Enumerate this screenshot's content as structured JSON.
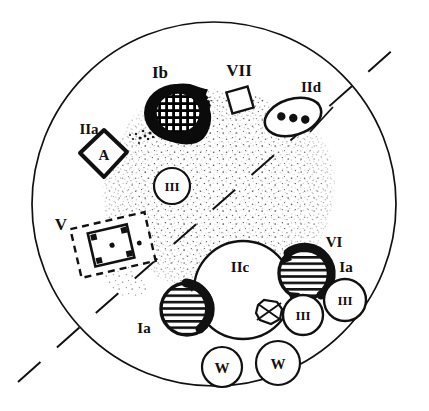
{
  "figure": {
    "background_color": "#ffffff",
    "ink_color": "#111111",
    "outline": {
      "name": "cell-boundary-circle",
      "cx": 214,
      "cy": 204,
      "rx": 182,
      "ry": 182
    },
    "section_line": {
      "name": "dashed-section-line",
      "style": "dashed",
      "x1": 18,
      "y1": 382,
      "x2": 404,
      "y2": 40
    },
    "stipple_region": {
      "name": "stippled-cytoplasm-zone",
      "description": "irregular dotted / stippled blob occupying the central region"
    }
  },
  "labels": [
    {
      "id": "Ib",
      "text": "Ib",
      "x": 160,
      "y": 78,
      "size": "lg"
    },
    {
      "id": "VII",
      "text": "VII",
      "x": 218,
      "y": 75,
      "size": "lg"
    },
    {
      "id": "IId",
      "text": "IId",
      "x": 292,
      "y": 90,
      "size": "md"
    },
    {
      "id": "IIa",
      "text": "IIa",
      "x": 73,
      "y": 133,
      "size": "md"
    },
    {
      "id": "V",
      "text": "V",
      "x": 57,
      "y": 228,
      "size": "lg"
    },
    {
      "id": "VI",
      "text": "VI",
      "x": 323,
      "y": 244,
      "size": "md"
    },
    {
      "id": "Ia_right",
      "text": "Ia",
      "x": 336,
      "y": 270,
      "size": "md"
    },
    {
      "id": "IIc",
      "text": "IIc",
      "x": 232,
      "y": 268,
      "size": "md"
    },
    {
      "id": "Ia_left",
      "text": "Ia",
      "x": 136,
      "y": 331,
      "size": "md"
    }
  ],
  "organelles": [
    {
      "name": "Ib-crosshatched-body",
      "label": "Ib",
      "shape": "blob",
      "fill": "black-with-grid-hatch",
      "cx": 176,
      "cy": 113,
      "rx": 31,
      "ry": 27
    },
    {
      "name": "VII-square",
      "label": "VII",
      "shape": "rotated-square",
      "fill": "white",
      "cx": 240,
      "cy": 99,
      "size": 20,
      "rotation": -15
    },
    {
      "name": "IId-ellipse-with-dots",
      "label": "IId",
      "shape": "ellipse",
      "fill": "white",
      "cx": 292,
      "cy": 116,
      "rx": 27,
      "ry": 17,
      "rotation": -18,
      "inner_dots": 3
    },
    {
      "name": "IIa-diamond-A",
      "label": "IIa",
      "inner_text": "A",
      "shape": "rounded-diamond",
      "fill": "white",
      "cx": 104,
      "cy": 155,
      "size": 23
    },
    {
      "name": "III-circle-center",
      "label": "III",
      "inner_text": "III",
      "shape": "circle",
      "fill": "white",
      "cx": 172,
      "cy": 186,
      "r": 17
    },
    {
      "name": "V-dashed-box",
      "label": "V",
      "shape": "dashed-rectangle-with-inner-square",
      "fill": "white",
      "cx": 113,
      "cy": 244,
      "w": 74,
      "h": 48,
      "rotation": -13,
      "inner_corner_squares": 4,
      "inner_center_dot": true
    },
    {
      "name": "IIc-large-circle",
      "label": "IIc",
      "inner_text": "IIc",
      "shape": "circle",
      "fill": "white",
      "cx": 243,
      "cy": 290,
      "r": 48
    },
    {
      "name": "Ia-striped-circle-left",
      "label": "Ia",
      "shape": "circle-horizontal-stripes-thick-arc",
      "fill": "striped",
      "cx": 187,
      "cy": 308,
      "r": 25
    },
    {
      "name": "Ia-striped-circle-right",
      "label": "Ia",
      "shape": "circle-horizontal-stripes-thick-arc",
      "fill": "striped",
      "cx": 305,
      "cy": 273,
      "r": 25
    },
    {
      "name": "X-marked-polygon",
      "shape": "octagon-with-cross",
      "fill": "white",
      "cx": 270,
      "cy": 312,
      "r": 14
    },
    {
      "name": "III-circle-lower",
      "label": "III",
      "inner_text": "III",
      "shape": "circle",
      "fill": "white",
      "cx": 303,
      "cy": 314,
      "r": 19
    },
    {
      "name": "III-circle-right",
      "label": "III",
      "inner_text": "III",
      "shape": "circle",
      "fill": "white",
      "cx": 344,
      "cy": 300,
      "r": 20
    },
    {
      "name": "W-circle-left",
      "label": "W",
      "inner_text": "W",
      "shape": "circle",
      "fill": "white",
      "cx": 222,
      "cy": 367,
      "r": 19
    },
    {
      "name": "W-circle-right",
      "label": "W",
      "inner_text": "W",
      "shape": "circle",
      "fill": "white",
      "cx": 277,
      "cy": 363,
      "r": 21
    }
  ],
  "inner_texts": {
    "a": "A",
    "iii": "III",
    "iic": "IIc",
    "w": "W"
  }
}
